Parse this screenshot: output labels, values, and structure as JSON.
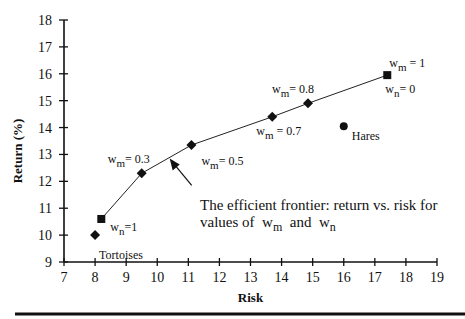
{
  "chart_data": {
    "type": "scatter",
    "title": "",
    "xlabel": "Risk",
    "ylabel": "Return (%)",
    "xlim": [
      7,
      19
    ],
    "ylim": [
      9,
      18
    ],
    "xticks": [
      7,
      8,
      9,
      10,
      11,
      12,
      13,
      14,
      15,
      16,
      17,
      18,
      19
    ],
    "yticks": [
      9,
      10,
      11,
      12,
      13,
      14,
      15,
      16,
      17,
      18
    ],
    "grid": false,
    "series": [
      {
        "name": "Efficient frontier",
        "style": "line-with-markers",
        "points": [
          {
            "x": 8.2,
            "y": 10.6,
            "marker": "square",
            "label": "w_n=1"
          },
          {
            "x": 9.5,
            "y": 12.3,
            "marker": "diamond",
            "label": "w_m= 0.3"
          },
          {
            "x": 11.1,
            "y": 13.35,
            "marker": "diamond",
            "label": "w_m= 0.5"
          },
          {
            "x": 13.7,
            "y": 14.4,
            "marker": "diamond",
            "label": "w_m = 0.7"
          },
          {
            "x": 14.85,
            "y": 14.9,
            "marker": "diamond",
            "label": "w_m= 0.8"
          },
          {
            "x": 17.4,
            "y": 15.95,
            "marker": "square",
            "label": "w_m = 1 / w_n= 0"
          }
        ]
      },
      {
        "name": "Tortoises",
        "style": "marker",
        "points": [
          {
            "x": 8.0,
            "y": 10.0,
            "marker": "diamond",
            "label": "Tortoises"
          }
        ]
      },
      {
        "name": "Hares",
        "style": "marker",
        "points": [
          {
            "x": 16.0,
            "y": 14.05,
            "marker": "circle",
            "label": "Hares"
          }
        ]
      }
    ],
    "annotations": [
      {
        "text_line1": "The efficient frontier: return vs. risk for",
        "text_line2_prefix": "values of",
        "sym1": "w",
        "sub1": "m",
        "conj": "and",
        "sym2": "w",
        "sub2": "n",
        "arrow_target": {
          "x": 10.4,
          "y": 12.85
        }
      }
    ]
  },
  "labels": {
    "tortoises": "Tortoises",
    "hares": "Hares",
    "w": "w",
    "m": "m",
    "n": "n",
    "eq1": "=1",
    "eq03": "= 0.3",
    "eq05": "= 0.5",
    "eq07": " = 0.7",
    "eq08": "= 0.8",
    "eq1b": " = 1",
    "eq0": "= 0"
  }
}
